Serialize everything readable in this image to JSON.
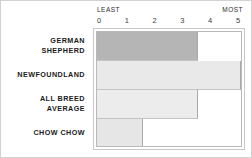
{
  "chart_data": {
    "type": "bar",
    "orientation": "horizontal",
    "title": "",
    "xlabel": "",
    "ylabel": "",
    "xlim": [
      0,
      5
    ],
    "grid": false,
    "legend": null,
    "axis_endcaps": {
      "low": "LEAST",
      "high": "MOST"
    },
    "tick_labels": [
      "0",
      "1",
      "2",
      "3",
      "4",
      "5"
    ],
    "tick_values": [
      0,
      1,
      2,
      3,
      4,
      5
    ],
    "categories": [
      "GERMAN SHEPHERD",
      "NEWFOUNDLAND",
      "ALL BREED AVERAGE",
      "CHOW CHOW"
    ],
    "values": [
      3.5,
      5.1,
      3.5,
      1.6
    ],
    "bars": [
      {
        "label_lines": [
          "GERMAN",
          "SHEPHERD"
        ],
        "value": 3.5,
        "color": "#b5b5b5"
      },
      {
        "label_lines": [
          "NEWFOUNDLAND"
        ],
        "value": 5.1,
        "color": "#e9e9e9"
      },
      {
        "label_lines": [
          "ALL BREED",
          "AVERAGE"
        ],
        "value": 3.5,
        "color": "#ececec"
      },
      {
        "label_lines": [
          "CHOW CHOW"
        ],
        "value": 1.6,
        "color": "#e6e6e6"
      }
    ]
  },
  "colors": {
    "highlight_bar": "#b5b5b5",
    "default_bar": "#e9e9e9",
    "frame": "#b9b9b9",
    "outer_border": "#d2d2d2",
    "text": "#1a1a1a",
    "tick_text": "#3a3a3a"
  }
}
